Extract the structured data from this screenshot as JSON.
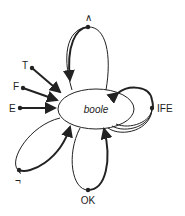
{
  "diagram": {
    "center_node": {
      "label": "boole"
    },
    "nodes": [
      {
        "id": "and",
        "label": "∧"
      },
      {
        "id": "T",
        "label": "T"
      },
      {
        "id": "F",
        "label": "F"
      },
      {
        "id": "E",
        "label": "E"
      },
      {
        "id": "IFE",
        "label": "IFE"
      },
      {
        "id": "not",
        "label": "¬"
      },
      {
        "id": "OK",
        "label": "OK"
      }
    ],
    "edges": [
      {
        "from": "T",
        "to": "boole"
      },
      {
        "from": "F",
        "to": "boole"
      },
      {
        "from": "E",
        "to": "boole"
      },
      {
        "from": "boole",
        "to": "and",
        "loop": true
      },
      {
        "from": "boole",
        "to": "IFE",
        "loop": true,
        "parallel": 3
      },
      {
        "from": "boole",
        "to": "not",
        "loop": true
      },
      {
        "from": "boole",
        "to": "OK",
        "loop": true
      }
    ]
  }
}
